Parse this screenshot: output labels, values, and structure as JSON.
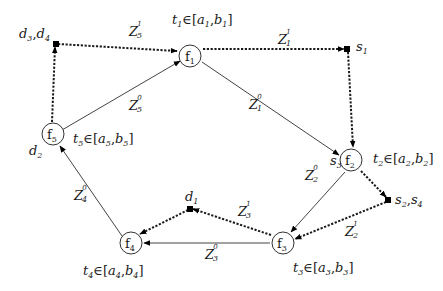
{
  "diagram": {
    "nodes": [
      {
        "id": "f1",
        "label": "f",
        "sub": "1",
        "interval": {
          "t": "t",
          "t_sub": "1",
          "a": "a",
          "a_sub": "1",
          "b": "b",
          "b_sub": "1"
        }
      },
      {
        "id": "f2",
        "label": "f",
        "sub": "2",
        "interval": {
          "t": "t",
          "t_sub": "2",
          "a": "a",
          "a_sub": "2",
          "b": "b",
          "b_sub": "2"
        }
      },
      {
        "id": "f3",
        "label": "f",
        "sub": "3",
        "interval": {
          "t": "t",
          "t_sub": "3",
          "a": "a",
          "a_sub": "3",
          "b": "b",
          "b_sub": "3"
        }
      },
      {
        "id": "f4",
        "label": "f",
        "sub": "4",
        "interval": {
          "t": "t",
          "t_sub": "4",
          "a": "a",
          "a_sub": "4",
          "b": "b",
          "b_sub": "4"
        }
      },
      {
        "id": "f5",
        "label": "f",
        "sub": "5",
        "interval": {
          "t": "t",
          "t_sub": "5",
          "a": "a",
          "a_sub": "5",
          "b": "b",
          "b_sub": "5"
        }
      }
    ],
    "elem_symbol": "∈",
    "bracket_open": "[",
    "bracket_close": "]",
    "comma": ",",
    "points": {
      "d3d4": {
        "a": "d",
        "a_sub": "3",
        "b": "d",
        "b_sub": "4"
      },
      "s1": {
        "a": "s",
        "a_sub": "1"
      },
      "s2s4": {
        "a": "s",
        "a_sub": "2",
        "b": "s",
        "b_sub": "4"
      },
      "d1": {
        "a": "d",
        "a_sub": "1"
      },
      "d2": {
        "a": "d",
        "a_sub": "2"
      },
      "s3": {
        "a": "s",
        "a_sub": "3"
      }
    },
    "edges": [
      {
        "id": "z1_0",
        "from": "f1",
        "to": "f2",
        "style": "solid",
        "label": "Z",
        "sub": "1",
        "sup": "0"
      },
      {
        "id": "z1_1a",
        "from": "f1",
        "to": "s1",
        "style": "dashed",
        "label": "Z",
        "sub": "1",
        "sup": "1"
      },
      {
        "id": "z1_1b",
        "from": "s1",
        "to": "f2",
        "style": "dashed"
      },
      {
        "id": "z2_0",
        "from": "f2",
        "to": "f3",
        "style": "solid",
        "label": "Z",
        "sub": "2",
        "sup": "0"
      },
      {
        "id": "z2_1a",
        "from": "f2",
        "to": "s2s4",
        "style": "dashed"
      },
      {
        "id": "z2_1b",
        "from": "s2s4",
        "to": "f3",
        "style": "dashed",
        "label": "Z",
        "sub": "2",
        "sup": "1"
      },
      {
        "id": "z3_0",
        "from": "f3",
        "to": "f4",
        "style": "solid",
        "label": "Z",
        "sub": "3",
        "sup": "0"
      },
      {
        "id": "z3_1a",
        "from": "f3",
        "to": "d1",
        "style": "dashed",
        "label": "Z",
        "sub": "3",
        "sup": "1"
      },
      {
        "id": "z3_1b",
        "from": "d1",
        "to": "f4",
        "style": "dashed"
      },
      {
        "id": "z4_0",
        "from": "f4",
        "to": "f5",
        "style": "solid",
        "label": "Z",
        "sub": "4",
        "sup": "0"
      },
      {
        "id": "z5_0",
        "from": "f5",
        "to": "f1",
        "style": "solid",
        "label": "Z",
        "sub": "5",
        "sup": "0"
      },
      {
        "id": "z5_1a",
        "from": "f5",
        "to": "d3d4",
        "style": "dashed"
      },
      {
        "id": "z5_1b",
        "from": "d3d4",
        "to": "f1",
        "style": "dashed",
        "label": "Z",
        "sub": "5",
        "sup": "1"
      }
    ],
    "colors": {
      "stroke": "#333333",
      "text": "#1a1a1a",
      "background": "#ffffff"
    }
  }
}
